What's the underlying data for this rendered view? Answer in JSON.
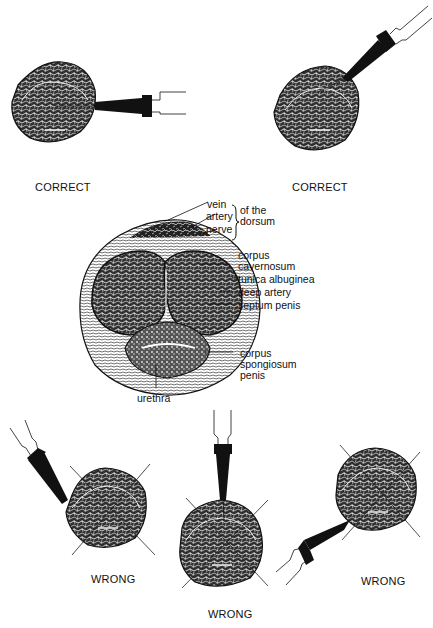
{
  "panels": {
    "correct_left": {
      "caption": "CORRECT",
      "verdict": "correct",
      "probe_direction": "from right, horizontal"
    },
    "correct_right": {
      "caption": "CORRECT",
      "verdict": "correct",
      "probe_direction": "from upper right, oblique"
    },
    "wrong_left": {
      "caption": "WRONG",
      "verdict": "wrong",
      "probe_direction": "from upper left, oblique"
    },
    "wrong_middle": {
      "caption": "WRONG",
      "verdict": "wrong",
      "probe_direction": "from top, vertical"
    },
    "wrong_right": {
      "caption": "WRONG",
      "verdict": "wrong",
      "probe_direction": "from lower left, oblique"
    }
  },
  "anatomy": {
    "labels": {
      "vein": "vein",
      "artery": "artery",
      "nerve": "nerve",
      "of_the": "of the",
      "dorsum": "dorsum",
      "corpus_cavernosum_1": "corpus",
      "corpus_cavernosum_2": "cavernosum",
      "tunica_albuginea": "tunica albuginea",
      "deep_artery": "deep artery",
      "septum_penis": "septum penis",
      "corpus_spongiosum_1": "corpus",
      "corpus_spongiosum_2": "spongiosum",
      "corpus_spongiosum_3": "penis",
      "urethra": "urethra"
    }
  },
  "colors": {
    "ink": "#111111",
    "background": "#ffffff",
    "tissue_fill": "#3a3a3a",
    "tissue_light": "#bdbdbd"
  }
}
